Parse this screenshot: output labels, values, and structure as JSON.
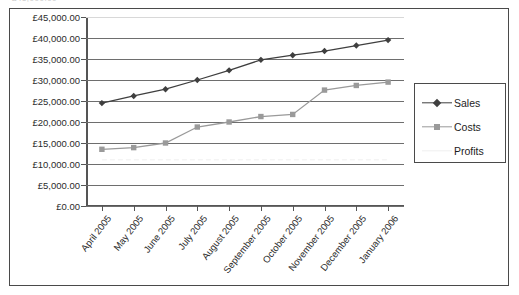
{
  "clipped_header_text": "£45,000.00",
  "chart_data": {
    "type": "line",
    "title": "",
    "xlabel": "",
    "ylabel": "",
    "ylim": [
      0,
      45000
    ],
    "ytick_step": 5000,
    "grid": true,
    "legend_position": "right",
    "currency_symbol": "£",
    "ytick_labels": [
      "£45,000.00",
      "£40,000.00",
      "£35,000.00",
      "£30,000.00",
      "£25,000.00",
      "£20,000.00",
      "£15,000.00",
      "£10,000.00",
      "£5,000.00",
      "£0.00"
    ],
    "ytick_values": [
      45000,
      40000,
      35000,
      30000,
      25000,
      20000,
      15000,
      10000,
      5000,
      0
    ],
    "categories": [
      "April 2005",
      "May 2005",
      "June 2005",
      "July 2005",
      "August 2005",
      "September 2005",
      "October 2005",
      "November 2005",
      "December 2005",
      "January 2006"
    ],
    "series": [
      {
        "name": "Sales",
        "color": "#3f3f3f",
        "marker": "diamond",
        "values": [
          24500,
          26200,
          27800,
          30000,
          32300,
          34800,
          35900,
          36900,
          38200,
          39500
        ]
      },
      {
        "name": "Costs",
        "color": "#9a9a9a",
        "marker": "square",
        "values": [
          13500,
          13900,
          15000,
          18800,
          20000,
          21300,
          21800,
          27600,
          28700,
          29500
        ]
      },
      {
        "name": "Profits",
        "color": "#efefef",
        "marker": "none",
        "values": [
          11000,
          11000,
          11000,
          11000,
          11000,
          11000,
          11000,
          11000,
          11000,
          11000
        ]
      }
    ]
  },
  "legend": {
    "entries": [
      {
        "label": "Sales"
      },
      {
        "label": "Costs"
      },
      {
        "label": "Profits"
      }
    ]
  }
}
